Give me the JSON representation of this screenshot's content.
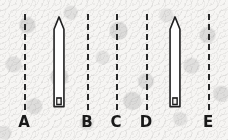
{
  "figure": {
    "width": 228,
    "height": 140,
    "background_color": "#f4f3f1",
    "ink_color": "#2b2b2b",
    "label_color": "#1b1b1b"
  },
  "reference_lines": [
    {
      "id": "line-a",
      "label": "A",
      "x": 24,
      "y_top": 14,
      "y_bottom": 110,
      "style": "dashed"
    },
    {
      "id": "line-b",
      "label": "B",
      "x": 87,
      "y_top": 14,
      "y_bottom": 110,
      "style": "dashed"
    },
    {
      "id": "line-c",
      "label": "C",
      "x": 116,
      "y_top": 14,
      "y_bottom": 110,
      "style": "dashed"
    },
    {
      "id": "line-d",
      "label": "D",
      "x": 146,
      "y_top": 14,
      "y_bottom": 110,
      "style": "dashed"
    },
    {
      "id": "line-e",
      "label": "E",
      "x": 208,
      "y_top": 14,
      "y_bottom": 110,
      "style": "dashed"
    }
  ],
  "labels": [
    {
      "text": "A",
      "x": 24,
      "y": 115
    },
    {
      "text": "B",
      "x": 87,
      "y": 115
    },
    {
      "text": "C",
      "x": 116,
      "y": 115
    },
    {
      "text": "D",
      "x": 146,
      "y": 115
    },
    {
      "text": "E",
      "x": 208,
      "y": 115
    }
  ],
  "needles": [
    {
      "id": "needle-left",
      "name": "probe-left",
      "x_center": 59,
      "y_top": 15,
      "y_bottom": 110,
      "body_width": 12,
      "tip_height": 14,
      "tip_shape": "pointed",
      "base_marker": "filled-rectangle",
      "between_labels": "A-B"
    },
    {
      "id": "needle-right",
      "name": "probe-right",
      "x_center": 175,
      "y_top": 15,
      "y_bottom": 110,
      "body_width": 12,
      "tip_height": 14,
      "tip_shape": "pointed",
      "base_marker": "filled-rectangle",
      "between_labels": "D-E"
    }
  ]
}
